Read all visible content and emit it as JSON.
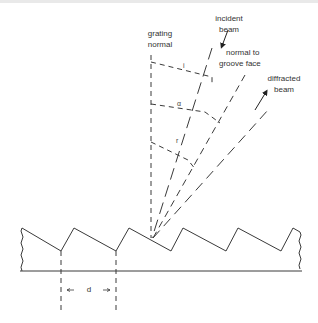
{
  "labels": {
    "grating_normal_l1": "grating",
    "grating_normal_l2": "normal",
    "incident_l1": "incident",
    "incident_l2": "beam",
    "groove_l1": "normal to",
    "groove_l2": "groove face",
    "diffracted_l1": "diffracted",
    "diffracted_l2": "beam",
    "spacing": "d"
  },
  "angles": {
    "incidence": "i",
    "blaze": "α",
    "diffraction": "r"
  },
  "colors": {
    "line": "#3a3a3a",
    "text": "#333333",
    "background": "#ffffff"
  },
  "grating": {
    "peaks_x": [
      22,
      74,
      129,
      183,
      238,
      293
    ],
    "valleys_x": [
      61,
      116,
      171,
      226,
      281
    ],
    "peak_y": 228,
    "valley_y": 251,
    "base_y": 271
  }
}
